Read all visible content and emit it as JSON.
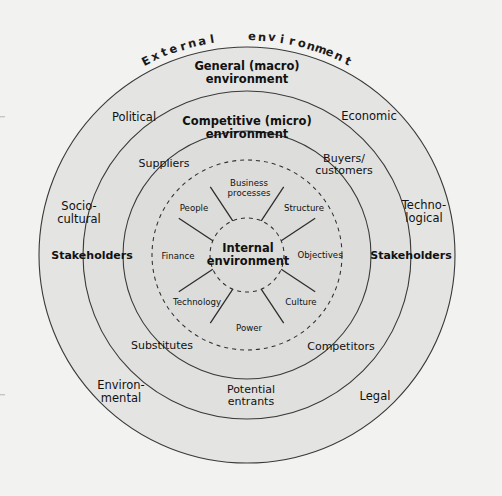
{
  "diagram": {
    "background_color": "#f2f2f0",
    "ring_fill_color": "#e3e3e1",
    "line_color": "#3a3a3a",
    "rings": {
      "outer": {
        "name": "External environment",
        "heading": "External   environment"
      },
      "macro": {
        "name": "General (macro) environment",
        "heading_line1": "General (macro)",
        "heading_line2": "environment",
        "factors": [
          {
            "id": "political",
            "label": "Political"
          },
          {
            "id": "economic",
            "label": "Economic"
          },
          {
            "id": "technological",
            "label": "Techno-\nlogical"
          },
          {
            "id": "legal",
            "label": "Legal"
          },
          {
            "id": "environmental",
            "label": "Environ-\nmental"
          },
          {
            "id": "socio-cultural",
            "label": "Socio-\ncultural"
          }
        ],
        "stakeholders_left": "Stakeholders",
        "stakeholders_right": "Stakeholders"
      },
      "micro": {
        "name": "Competitive (micro) environment",
        "heading_line1": "Competitive (micro)",
        "heading_line2": "environment",
        "forces": [
          {
            "id": "suppliers",
            "label": "Suppliers"
          },
          {
            "id": "buyers-customers",
            "label": "Buyers/\ncustomers"
          },
          {
            "id": "competitors",
            "label": "Competitors"
          },
          {
            "id": "potential-entrants",
            "label": "Potential\nentrants"
          },
          {
            "id": "substitutes",
            "label": "Substitutes"
          }
        ]
      },
      "internal": {
        "name": "Internal environment",
        "center_line1": "Internal",
        "center_line2": "environment",
        "segments": [
          {
            "id": "business-processes",
            "label": "Business\nprocesses"
          },
          {
            "id": "structure",
            "label": "Structure"
          },
          {
            "id": "objectives",
            "label": "Objectives"
          },
          {
            "id": "culture",
            "label": "Culture"
          },
          {
            "id": "power",
            "label": "Power"
          },
          {
            "id": "technology",
            "label": "Technology"
          },
          {
            "id": "finance",
            "label": "Finance"
          },
          {
            "id": "people",
            "label": "People"
          }
        ]
      }
    }
  }
}
